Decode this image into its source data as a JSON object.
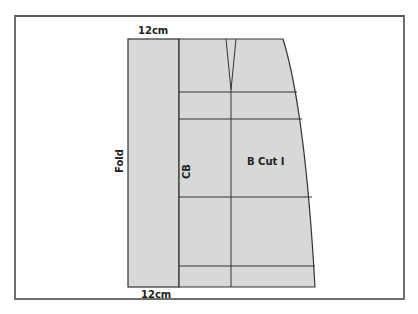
{
  "diagram": {
    "type": "sewing-pattern",
    "piece_name": "B Cut I",
    "labels": {
      "top_width": "12cm",
      "bottom_width": "12cm",
      "fold": "Fold",
      "center_back": "CB",
      "piece": "B Cut I"
    },
    "colors": {
      "fill": "#d8d8d8",
      "line": "#333333",
      "frame": "#6f6f6f",
      "text": "#222222"
    }
  }
}
